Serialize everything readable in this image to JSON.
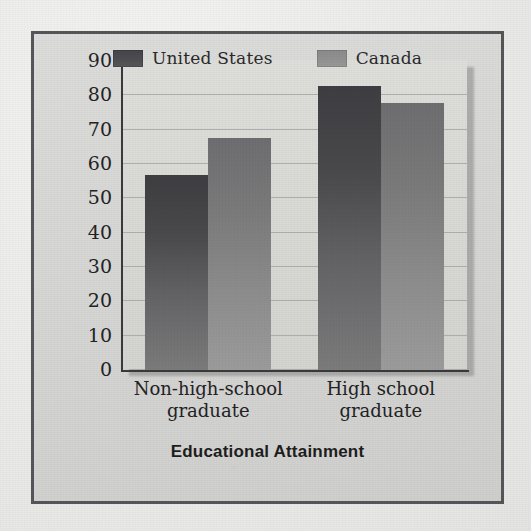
{
  "chart_data": {
    "type": "bar",
    "title": "",
    "xlabel": "Educational Attainment",
    "ylabel": "Percentage Employed",
    "categories": [
      "Non-high-school graduate",
      "High school graduate"
    ],
    "category_lines": [
      [
        "Non-high-school",
        "graduate"
      ],
      [
        "High school",
        "graduate"
      ]
    ],
    "series": [
      {
        "name": "United States",
        "values": [
          57,
          83
        ],
        "color": "#4a4a4d"
      },
      {
        "name": "Canada",
        "values": [
          68,
          78
        ],
        "color": "#8d8d8e"
      }
    ],
    "ylim": [
      0,
      90
    ],
    "ytick_values": [
      90,
      80,
      70,
      60,
      50,
      40,
      30,
      20,
      10,
      0
    ],
    "ytick_labels": [
      "90",
      "80",
      "70",
      "60",
      "50",
      "40",
      "30",
      "20",
      "10",
      "0"
    ],
    "grid": true,
    "grid_axis": "y",
    "legend_position": "top-center"
  },
  "legend": {
    "items": [
      {
        "label": "United States",
        "swatch": "us"
      },
      {
        "label": "Canada",
        "swatch": "ca"
      }
    ]
  },
  "colors": {
    "frame": "#55565a",
    "panel_background": "#d9d9d6",
    "gridline": "#a7a7a4",
    "axis": "#3a3a3c",
    "united_states": "#4a4a4d",
    "canada": "#8d8d8e",
    "text": "#232325"
  }
}
